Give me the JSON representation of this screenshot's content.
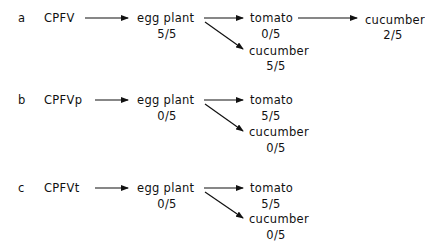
{
  "panels": [
    {
      "label": "a",
      "virus": "CPFV",
      "host1": {
        "name": "egg plant",
        "score": "5/5"
      },
      "branch_top": {
        "name": "tomato",
        "score": "0/5"
      },
      "branch_bottom": {
        "name": "cucumber",
        "score": "5/5"
      },
      "branch_extra": {
        "name": "cucumber",
        "score": "2/5"
      }
    },
    {
      "label": "b",
      "virus": "CPFVp",
      "host1": {
        "name": "egg plant",
        "score": "0/5"
      },
      "branch_top": {
        "name": "tomato",
        "score": "5/5"
      },
      "branch_bottom": {
        "name": "cucumber",
        "score": "0/5"
      }
    },
    {
      "label": "c",
      "virus": "CPFVt",
      "host1": {
        "name": "egg plant",
        "score": "0/5"
      },
      "branch_top": {
        "name": "tomato",
        "score": "5/5"
      },
      "branch_bottom": {
        "name": "cucumber",
        "score": "0/5"
      }
    }
  ]
}
